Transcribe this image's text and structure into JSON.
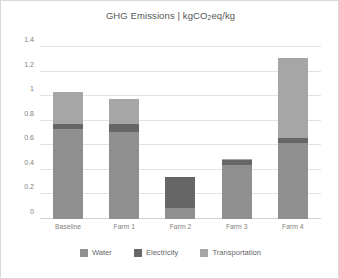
{
  "chart_data": {
    "type": "bar",
    "stacked": true,
    "title": "GHG Emissions | kgCO2eq/kg",
    "title_parts": {
      "before": "GHG Emissions | kgCO",
      "sub": "2",
      "after": "eq/kg"
    },
    "xlabel": "",
    "ylabel": "",
    "ylim": [
      0,
      1.4
    ],
    "yticks": [
      0,
      0.2,
      0.4,
      0.6,
      0.8,
      1,
      1.2,
      1.4
    ],
    "ytick_labels": [
      "0",
      "0.2",
      "0.4",
      "0.6",
      "0.8",
      "1",
      "1.2",
      "1.4"
    ],
    "grid": true,
    "legend_position": "bottom",
    "categories": [
      "Baseline",
      "Farm 1",
      "Farm 2",
      "Farm 3",
      "Farm 4"
    ],
    "series": [
      {
        "name": "Water",
        "color": "#8f8f8f",
        "values": [
          0.73,
          0.71,
          0.09,
          0.44,
          0.62
        ]
      },
      {
        "name": "Electricity",
        "color": "#666666",
        "values": [
          0.04,
          0.06,
          0.25,
          0.04,
          0.04
        ]
      },
      {
        "name": "Transportation",
        "color": "#a6a6a6",
        "values": [
          0.26,
          0.21,
          0.0,
          0.01,
          0.65
        ]
      }
    ],
    "totals": [
      1.03,
      0.98,
      0.34,
      0.49,
      1.31
    ]
  },
  "legend": {
    "items": [
      {
        "label": "Water",
        "color": "#8f8f8f"
      },
      {
        "label": "Electricity",
        "color": "#666666"
      },
      {
        "label": "Transportation",
        "color": "#a6a6a6"
      }
    ]
  }
}
